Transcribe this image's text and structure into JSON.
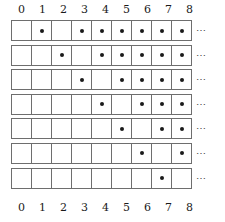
{
  "figure": {
    "name": "dot-grid-table",
    "columns": [
      0,
      1,
      2,
      3,
      4,
      5,
      6,
      7,
      8
    ],
    "top_axis_labels": [
      "0",
      "1",
      "2",
      "3",
      "4",
      "5",
      "6",
      "7",
      "8"
    ],
    "bottom_axis_labels": [
      "0",
      "1",
      "2",
      "3",
      "4",
      "5",
      "6",
      "7",
      "8"
    ],
    "continuation_symbol": "⋯",
    "row_count": 7,
    "column_count": 9,
    "dot_symbol": "•",
    "colors": {
      "cell_border": "#6e6e6e",
      "dot": "#1a1a1a",
      "background": "#ffffff",
      "label_text": "#1a1a1a",
      "ellipsis_text": "#4a4a4a"
    },
    "rows": [
      {
        "index": 1,
        "dots": [
          0,
          1,
          0,
          1,
          1,
          1,
          1,
          1,
          1
        ],
        "filled_columns": [
          1,
          3,
          4,
          5,
          6,
          7,
          8
        ],
        "continues": true
      },
      {
        "index": 2,
        "dots": [
          0,
          0,
          1,
          0,
          1,
          1,
          1,
          1,
          1
        ],
        "filled_columns": [
          2,
          4,
          5,
          6,
          7,
          8
        ],
        "continues": true
      },
      {
        "index": 3,
        "dots": [
          0,
          0,
          0,
          1,
          0,
          1,
          1,
          1,
          1
        ],
        "filled_columns": [
          3,
          5,
          6,
          7,
          8
        ],
        "continues": true
      },
      {
        "index": 4,
        "dots": [
          0,
          0,
          0,
          0,
          1,
          0,
          1,
          1,
          1
        ],
        "filled_columns": [
          4,
          6,
          7,
          8
        ],
        "continues": true
      },
      {
        "index": 5,
        "dots": [
          0,
          0,
          0,
          0,
          0,
          1,
          0,
          1,
          1
        ],
        "filled_columns": [
          5,
          7,
          8
        ],
        "continues": true
      },
      {
        "index": 6,
        "dots": [
          0,
          0,
          0,
          0,
          0,
          0,
          1,
          0,
          1
        ],
        "filled_columns": [
          6,
          8
        ],
        "continues": true
      },
      {
        "index": 7,
        "dots": [
          0,
          0,
          0,
          0,
          0,
          0,
          0,
          1,
          0
        ],
        "filled_columns": [
          7
        ],
        "continues": true
      }
    ]
  }
}
